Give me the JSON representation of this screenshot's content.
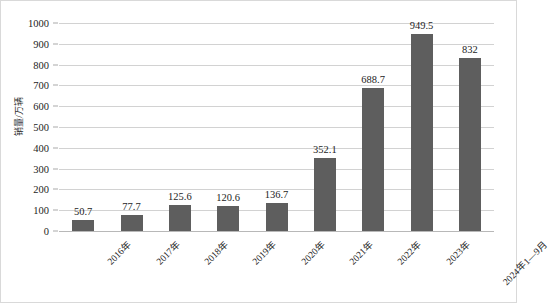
{
  "chart_data": {
    "type": "bar",
    "title": "",
    "subtitle": "",
    "xlabel": "",
    "ylabel": "销量/万辆",
    "categories": [
      "2016年",
      "2017年",
      "2018年",
      "2019年",
      "2020年",
      "2021年",
      "2022年",
      "2023年",
      "2024年1—9月"
    ],
    "values": [
      50.7,
      77.7,
      125.6,
      120.6,
      136.7,
      352.1,
      688.7,
      949.5,
      832
    ],
    "value_labels": [
      "50.7",
      "77.7",
      "125.6",
      "120.6",
      "136.7",
      "352.1",
      "688.7",
      "949.5",
      "832"
    ],
    "ylim": [
      0,
      1000
    ],
    "ytick_values": [
      0,
      100,
      200,
      300,
      400,
      500,
      600,
      700,
      800,
      900,
      1000
    ],
    "ytick_labels": [
      "0",
      "100",
      "200",
      "300",
      "400",
      "500",
      "600",
      "700",
      "800",
      "900",
      "1000"
    ],
    "grid": true,
    "legend": false,
    "legend_position": "none",
    "series": [
      {
        "name": "销量",
        "values": [
          50.7,
          77.7,
          125.6,
          120.6,
          136.7,
          352.1,
          688.7,
          949.5,
          832
        ]
      }
    ],
    "colors": {
      "bar": "#5e5e5e",
      "gridline": "#d2d2d2",
      "axis": "#b8b8b8",
      "text": "#1d1d1d",
      "background": "#ffffff",
      "border": "#d9d9d9"
    }
  }
}
